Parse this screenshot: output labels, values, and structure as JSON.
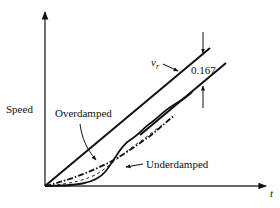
{
  "figure": {
    "type": "response-diagram",
    "axes": {
      "y_label": "Speed",
      "x_label": "t"
    },
    "labels": {
      "reference": "v",
      "reference_subscript": "r",
      "lag_value": "0.167",
      "overdamped": "Overdamped",
      "underdamped": "Underdamped"
    },
    "colors": {
      "stroke": "#111111",
      "background": "#ffffff"
    }
  }
}
